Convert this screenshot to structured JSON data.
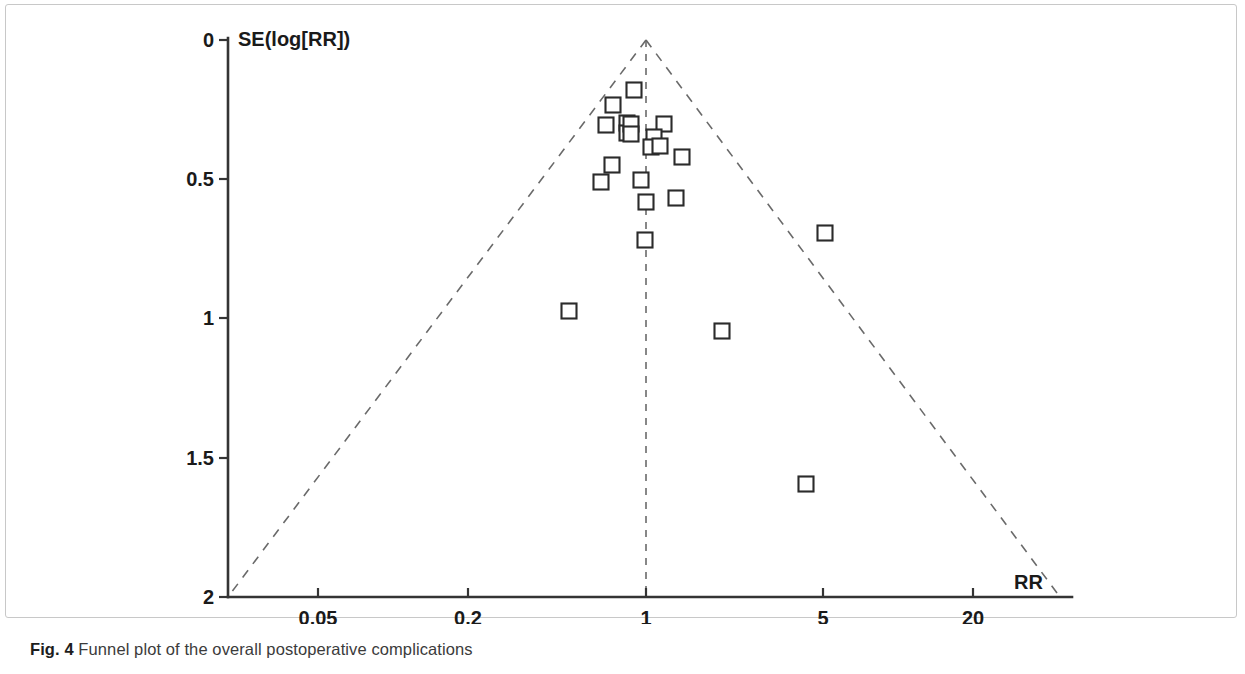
{
  "figure": {
    "caption_label": "Fig. 4",
    "caption_text": " Funnel plot of the overall postoperative complications"
  },
  "chart_data": {
    "type": "scatter",
    "title": "",
    "subtitle": "",
    "xlabel": "RR",
    "ylabel": "SE(log[RR])",
    "plot_kind": "funnel-plot",
    "x_scale": "log",
    "x_ticks": [
      "0.05",
      "0.2",
      "1",
      "5",
      "20"
    ],
    "x_tick_values": [
      0.05,
      0.2,
      1,
      5,
      20
    ],
    "y_ticks": [
      "0",
      "0.5",
      "1",
      "1.5",
      "2"
    ],
    "y_tick_values": [
      0,
      0.5,
      1,
      1.5,
      2
    ],
    "xlim": [
      0.0263,
      33.8
    ],
    "ylim": [
      0,
      2
    ],
    "y_axis_inverted": true,
    "grid": false,
    "legend": "none",
    "marker_style": "open-square",
    "marker_count": 22,
    "center_line_rr": 1,
    "funnel_apex": {
      "rr": 1,
      "se": 0
    },
    "funnel_left_base": {
      "rr": 0.0263,
      "se": 2
    },
    "funnel_right_base": {
      "rr": 33.8,
      "se": 2
    },
    "points": [
      {
        "rr": 0.99,
        "se": 0.115
      },
      {
        "rr": 0.79,
        "se": 0.155
      },
      {
        "rr": 0.73,
        "se": 0.263
      },
      {
        "rr": 0.84,
        "se": 0.255
      },
      {
        "rr": 0.85,
        "se": 0.285
      },
      {
        "rr": 1.12,
        "se": 0.258
      },
      {
        "rr": 1.03,
        "se": 0.295
      },
      {
        "rr": 1.02,
        "se": 0.33
      },
      {
        "rr": 1.29,
        "se": 0.365
      },
      {
        "rr": 0.68,
        "se": 0.405
      },
      {
        "rr": 0.63,
        "se": 0.465
      },
      {
        "rr": 0.97,
        "se": 0.455
      },
      {
        "rr": 1.01,
        "se": 0.53
      },
      {
        "rr": 1.16,
        "se": 0.515
      },
      {
        "rr": 0.99,
        "se": 0.695
      },
      {
        "rr": 5.0,
        "se": 0.695
      },
      {
        "rr": 0.44,
        "se": 0.97
      },
      {
        "rr": 2.1,
        "se": 1.04
      },
      {
        "rr": 4.3,
        "se": 1.58
      },
      {
        "rr": 0.88,
        "se": 0.258
      },
      {
        "rr": 0.88,
        "se": 0.285
      },
      {
        "rr": 1.09,
        "se": 0.325
      }
    ]
  },
  "axes_geometry": {
    "plot_left_px": 228,
    "plot_right_px": 1072,
    "plot_top_px": 40,
    "plot_bottom_px": 597,
    "x_tick_px": [
      318,
      468,
      646,
      823,
      973
    ],
    "y_tick_px": [
      40,
      179,
      318,
      458,
      597
    ],
    "center_px": 646,
    "funnel_left_base_px": 228,
    "funnel_right_base_px": 1060
  },
  "marker_positions_px": [
    {
      "x": 634,
      "y": 90
    },
    {
      "x": 613,
      "y": 105
    },
    {
      "x": 606,
      "y": 125
    },
    {
      "x": 627,
      "y": 123
    },
    {
      "x": 627,
      "y": 133
    },
    {
      "x": 664,
      "y": 124
    },
    {
      "x": 654,
      "y": 137
    },
    {
      "x": 651,
      "y": 147
    },
    {
      "x": 682,
      "y": 157
    },
    {
      "x": 612,
      "y": 165
    },
    {
      "x": 601,
      "y": 182
    },
    {
      "x": 641,
      "y": 180
    },
    {
      "x": 646,
      "y": 202
    },
    {
      "x": 676,
      "y": 198
    },
    {
      "x": 645,
      "y": 240
    },
    {
      "x": 825,
      "y": 233
    },
    {
      "x": 569,
      "y": 311
    },
    {
      "x": 722,
      "y": 331
    },
    {
      "x": 806,
      "y": 484
    },
    {
      "x": 631,
      "y": 124
    },
    {
      "x": 631,
      "y": 134
    },
    {
      "x": 660,
      "y": 146
    }
  ],
  "colors": {
    "axis": "#343434",
    "marker_stroke": "#2b2b2b",
    "marker_fill": "#ffffff",
    "dashed_guide": "#6a6a6a",
    "caption_text": "#3b3b3b",
    "frame": "#c8c8c8",
    "background": "#ffffff"
  }
}
